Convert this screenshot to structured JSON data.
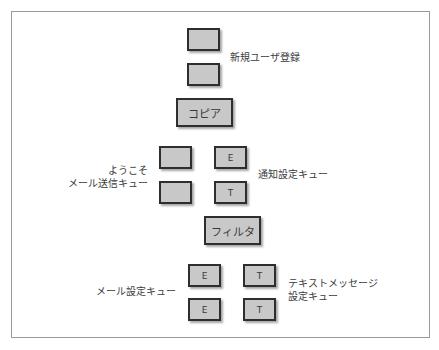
{
  "diagram": {
    "title": "",
    "nodes": [
      {
        "id": "signup_q1",
        "label": ""
      },
      {
        "id": "signup_q2",
        "label": ""
      },
      {
        "id": "copy",
        "label": "コピア"
      },
      {
        "id": "welcome_q1",
        "label": ""
      },
      {
        "id": "welcome_q2",
        "label": ""
      },
      {
        "id": "notify_e",
        "label": "E"
      },
      {
        "id": "notify_t",
        "label": "T"
      },
      {
        "id": "filter",
        "label": "フィルタ"
      },
      {
        "id": "mail_e1",
        "label": "E"
      },
      {
        "id": "mail_e2",
        "label": "E"
      },
      {
        "id": "text_t1",
        "label": "T"
      },
      {
        "id": "text_t2",
        "label": "T"
      }
    ],
    "labels": {
      "signup": "新規ユーザ登録",
      "welcome_line1": "ようこそ",
      "welcome_line2": "メール送信キュー",
      "notify": "通知設定キュー",
      "mail": "メール設定キュー",
      "text_line1": "テキストメッセージ",
      "text_line2": "設定キュー"
    },
    "colors": {
      "box_fill": "#c8c8c8",
      "box_border": "#2e2e2e",
      "frame_border": "#9a9a9a",
      "text": "#3c3c3c"
    }
  }
}
